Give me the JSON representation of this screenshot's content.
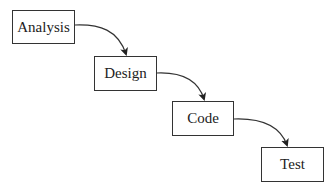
{
  "diagram": {
    "type": "waterfall-process",
    "stages": [
      {
        "label": "Analysis",
        "x": 12,
        "y": 10,
        "w": 63,
        "h": 34
      },
      {
        "label": "Design",
        "x": 94,
        "y": 56,
        "w": 63,
        "h": 35
      },
      {
        "label": "Code",
        "x": 172,
        "y": 101,
        "w": 62,
        "h": 35
      },
      {
        "label": "Test",
        "x": 261,
        "y": 147,
        "w": 63,
        "h": 35
      }
    ],
    "edges": [
      {
        "from": "Analysis",
        "to": "Design"
      },
      {
        "from": "Design",
        "to": "Code"
      },
      {
        "from": "Code",
        "to": "Test"
      }
    ],
    "colors": {
      "stroke": "#333333",
      "text": "#222222",
      "background": "#ffffff"
    }
  }
}
